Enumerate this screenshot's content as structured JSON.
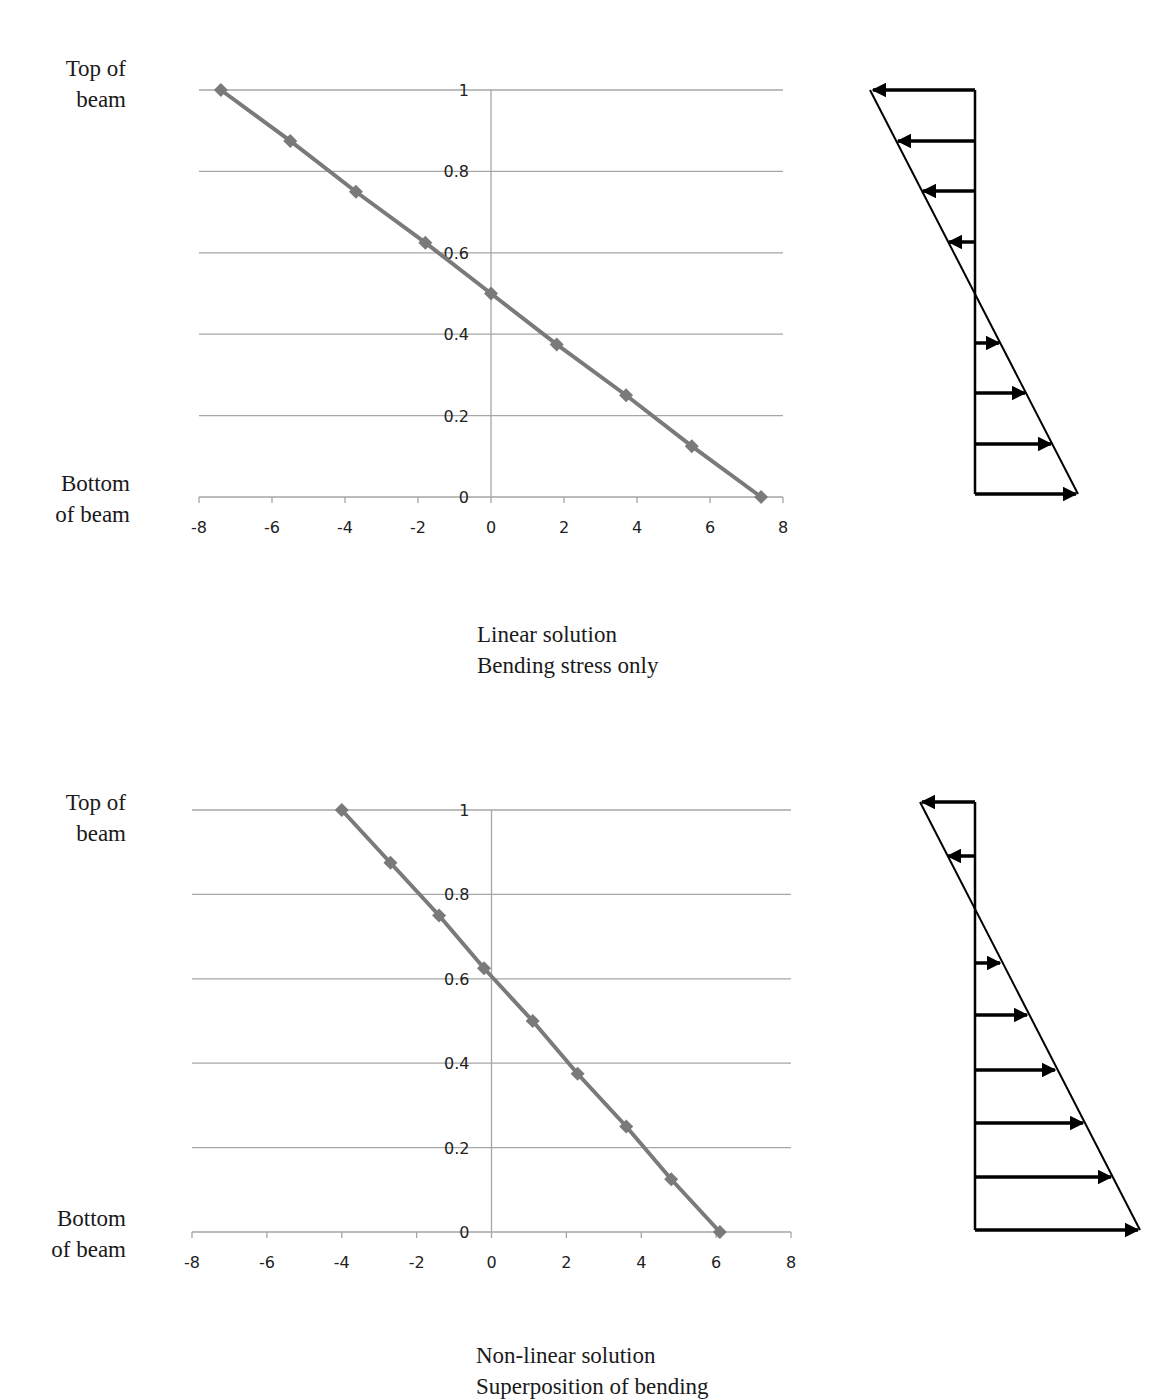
{
  "chart_data": [
    {
      "type": "line",
      "title": "Linear solution",
      "subtitle": "Bending stress only",
      "xlabel": "",
      "ylabel": "",
      "xlim": [
        -8,
        8
      ],
      "ylim": [
        0,
        1
      ],
      "xticks": [
        -8,
        -6,
        -4,
        -2,
        0,
        2,
        4,
        6,
        8
      ],
      "yticks": [
        0,
        0.2,
        0.4,
        0.6,
        0.8,
        1
      ],
      "grid": "horizontal",
      "legend": "none",
      "annotations": [
        "Top of beam",
        "Bottom of beam"
      ],
      "series": [
        {
          "name": "stress",
          "x": [
            -7.4,
            -5.5,
            -3.7,
            -1.8,
            0,
            1.8,
            3.7,
            5.5,
            7.4
          ],
          "y": [
            1,
            0.875,
            0.75,
            0.625,
            0.5,
            0.375,
            0.25,
            0.125,
            0
          ]
        }
      ]
    },
    {
      "type": "line",
      "title": "Non-linear solution",
      "subtitle": "Superposition of bending",
      "xlabel": "",
      "ylabel": "",
      "xlim": [
        -8,
        8
      ],
      "ylim": [
        0,
        1
      ],
      "xticks": [
        -8,
        -6,
        -4,
        -2,
        0,
        2,
        4,
        6,
        8
      ],
      "yticks": [
        0,
        0.2,
        0.4,
        0.6,
        0.8,
        1
      ],
      "grid": "horizontal",
      "legend": "none",
      "annotations": [
        "Top of beam",
        "Bottom of beam"
      ],
      "series": [
        {
          "name": "stress",
          "x": [
            -4.0,
            -2.7,
            -1.4,
            -0.2,
            1.1,
            2.3,
            3.6,
            4.8,
            6.1
          ],
          "y": [
            1,
            0.875,
            0.75,
            0.625,
            0.5,
            0.375,
            0.25,
            0.125,
            0
          ]
        }
      ]
    }
  ],
  "labels": {
    "top1": "Top of\nbeam",
    "bottom1": "Bottom\nof beam",
    "top2": "Top of\nbeam",
    "bottom2": "Bottom\nof beam",
    "top_line": "Top of",
    "top_line2": "beam",
    "bottom_line": "Bottom",
    "bottom_line2": "of beam"
  },
  "captions": {
    "chart1_line1": "Linear solution",
    "chart1_line2": "Bending stress only",
    "chart2_line1": "Non-linear solution",
    "chart2_line2": "Superposition of bending"
  },
  "colors": {
    "series": "#7a7a7a",
    "grid": "#a6a6a6",
    "arrow": "#000000"
  },
  "diagrams": [
    {
      "name": "stress-distribution-linear",
      "arrows_left": 4,
      "arrows_right": 4
    },
    {
      "name": "stress-distribution-nonlinear",
      "arrows_left": 2,
      "arrows_right": 6
    }
  ]
}
